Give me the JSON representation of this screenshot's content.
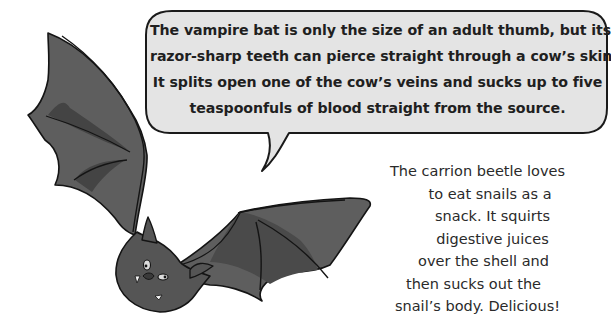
{
  "speech_bubble": {
    "lines": [
      "The vampire bat is only the size of an adult thumb, but its",
      "razor-sharp teeth can pierce straight through a cow’s skin.",
      "It splits open one of the cow’s veins and sucks up to five",
      "teaspoonfuls of blood straight from the source."
    ],
    "fill_color": "#e4e4e4",
    "border_color": "#1a1a1a"
  },
  "side_caption": {
    "lines": [
      "The carrion beetle loves",
      "to eat snails as a",
      "snack. It squirts",
      "digestive juices",
      "over the shell and",
      "then sucks out the",
      "snail’s body. Delicious!"
    ]
  },
  "illustration": {
    "subject": "vampire-bat",
    "body_color": "#5a5a5a",
    "dark_accent": "#3e3e3e",
    "outline_color": "#141414"
  }
}
